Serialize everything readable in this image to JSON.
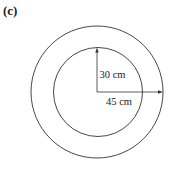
{
  "figure": {
    "label": "(c)",
    "inner_radius_label": "30 cm",
    "outer_radius_label": "45 cm",
    "stroke_color": "#333333",
    "background": "#ffffff"
  },
  "geometry": {
    "center": [
      97,
      92
    ],
    "outer_radius_px": 66,
    "inner_radius_px": 44.5
  }
}
